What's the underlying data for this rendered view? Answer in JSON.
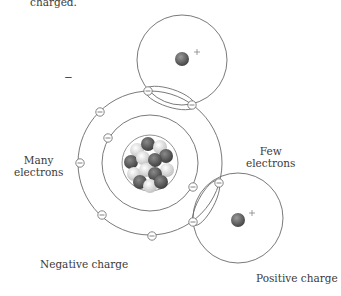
{
  "caption_fragment": "charged.",
  "labels": {
    "minus_sign": "−",
    "many_electrons": [
      "Many",
      "electrons"
    ],
    "few_electrons": [
      "Few",
      "electrons"
    ],
    "negative_charge": "Negative charge",
    "positive_charge": "Positive charge",
    "plus_sign": "+"
  },
  "atoms": {
    "top": {
      "cx": 182,
      "cy": 60,
      "r": 45,
      "nucleus_r": 7,
      "charge": "+"
    },
    "center": {
      "cx": 150,
      "cy": 163,
      "outer_r": 72,
      "inner_r": 48,
      "nucleus_r": 28
    },
    "bottom_right": {
      "cx": 238,
      "cy": 218,
      "r": 45,
      "nucleus_r": 7,
      "charge": "+"
    }
  },
  "electrons": [
    [
      148,
      91
    ],
    [
      192,
      105
    ],
    [
      100,
      112
    ],
    [
      80,
      163
    ],
    [
      102,
      215
    ],
    [
      152,
      236
    ],
    [
      219,
      183
    ],
    [
      193,
      222
    ],
    [
      108,
      138
    ],
    [
      193,
      187
    ]
  ],
  "colors": {
    "line": "#6a6a6a",
    "nucleus": "#555555",
    "proton": "#4a4a4a",
    "neutron": "#e8e8e8"
  }
}
